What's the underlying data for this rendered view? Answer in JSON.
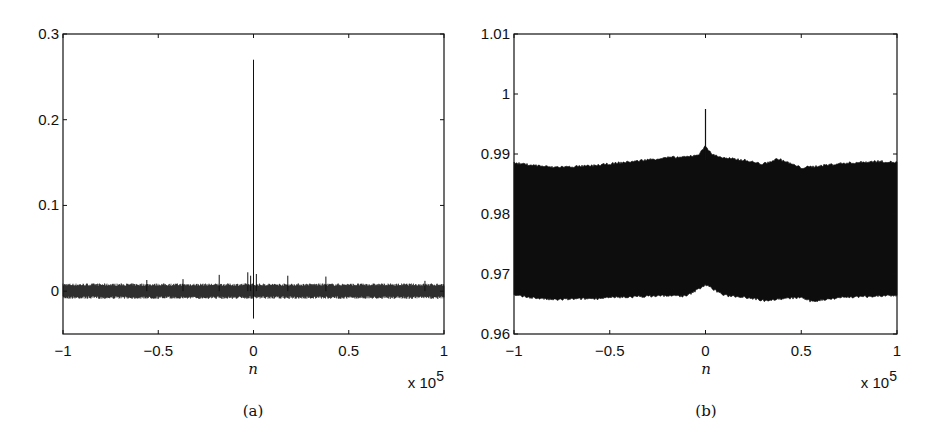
{
  "chart_data": [
    {
      "type": "line",
      "panel_label": "(a)",
      "title": "",
      "xlabel": "n",
      "ylabel": "",
      "x_multiplier": "x 10^5",
      "x_multiplier_base": "x 10",
      "x_multiplier_exp": "5",
      "xlim": [
        -1,
        1
      ],
      "ylim": [
        -0.05,
        0.3
      ],
      "xticks": [
        -1,
        -0.5,
        0,
        0.5,
        1
      ],
      "xtick_labels": [
        "−1",
        "−0.5",
        "0",
        "0.5",
        "1"
      ],
      "yticks": [
        0,
        0.1,
        0.2,
        0.3
      ],
      "ytick_labels": [
        "0",
        "0.1",
        "0.2",
        "0.3"
      ],
      "grid": false,
      "legend": null,
      "description": "Dense noise band around 0 (approx −0.005 to 0.005) across n in [−1e5, 1e5], with a single sharp spike at n=0 reaching ~0.27 and dipping to ~−0.03; small side spikes ~0.02 near n=0.",
      "series": [
        {
          "name": "signal",
          "band_low": -0.006,
          "band_high": 0.006,
          "peak": {
            "x": 0,
            "y": 0.27
          },
          "trough": {
            "x": 0,
            "y": -0.032
          },
          "side_spikes": [
            {
              "x": -0.03,
              "y": 0.022
            },
            {
              "x": -0.015,
              "y": 0.018
            },
            {
              "x": 0.015,
              "y": 0.02
            },
            {
              "x": -0.18,
              "y": 0.019
            },
            {
              "x": 0.18,
              "y": 0.018
            },
            {
              "x": 0.38,
              "y": 0.017
            },
            {
              "x": -0.56,
              "y": 0.013
            },
            {
              "x": -0.37,
              "y": 0.014
            },
            {
              "x": 0.9,
              "y": 0.012
            }
          ]
        }
      ]
    },
    {
      "type": "area",
      "panel_label": "(b)",
      "title": "",
      "xlabel": "n",
      "ylabel": "",
      "x_multiplier": "x 10^5",
      "x_multiplier_base": "x 10",
      "x_multiplier_exp": "5",
      "xlim": [
        -1,
        1
      ],
      "ylim": [
        0.96,
        1.01
      ],
      "xticks": [
        -1,
        -0.5,
        0,
        0.5,
        1
      ],
      "xtick_labels": [
        "−1",
        "−0.5",
        "0",
        "0.5",
        "1"
      ],
      "yticks": [
        0.96,
        0.97,
        0.98,
        0.99,
        1,
        1.01
      ],
      "ytick_labels": [
        "0.96",
        "0.97",
        "0.98",
        "0.99",
        "1",
        "1.01"
      ],
      "grid": false,
      "legend": null,
      "description": "Dense filled band between ~0.966 and ~0.988 across n; upper envelope rises near n=0 to ~0.991 with a spike to ~0.9975; lower envelope rises slightly near n=0 to ~0.968.",
      "series": [
        {
          "name": "signal",
          "upper_envelope": {
            "x": [
              -1,
              -0.8,
              -0.6,
              -0.37,
              -0.2,
              -0.1,
              -0.03,
              0,
              0.03,
              0.1,
              0.2,
              0.3,
              0.38,
              0.5,
              0.7,
              0.9,
              1
            ],
            "y": [
              0.9885,
              0.9878,
              0.988,
              0.9888,
              0.9894,
              0.9895,
              0.99,
              0.9915,
              0.99,
              0.9893,
              0.989,
              0.9883,
              0.9892,
              0.9877,
              0.9884,
              0.9888,
              0.9886
            ]
          },
          "lower_envelope": {
            "x": [
              -1,
              -0.8,
              -0.6,
              -0.37,
              -0.2,
              -0.1,
              0,
              0.1,
              0.2,
              0.3,
              0.5,
              0.55,
              0.7,
              0.9,
              1
            ],
            "y": [
              0.9664,
              0.9657,
              0.9659,
              0.9662,
              0.9664,
              0.9663,
              0.9682,
              0.9664,
              0.9662,
              0.9656,
              0.9661,
              0.9654,
              0.9661,
              0.9663,
              0.9664
            ]
          },
          "peak": {
            "x": 0,
            "y": 0.9975
          }
        }
      ]
    }
  ]
}
